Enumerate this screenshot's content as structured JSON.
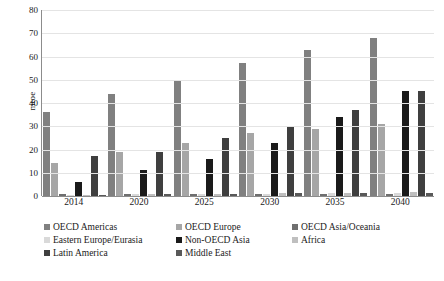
{
  "chart_data": {
    "type": "bar",
    "title": "",
    "subtitle": "",
    "xlabel": "",
    "ylabel": "mtoe",
    "ylim": [
      0,
      80
    ],
    "yticks": [
      0,
      10,
      20,
      30,
      40,
      50,
      60,
      70,
      80
    ],
    "grid": true,
    "legend_position": "bottom",
    "categories": [
      "2014",
      "2020",
      "2025",
      "2030",
      "2035",
      "2040"
    ],
    "series": [
      {
        "name": "OECD Americas",
        "color": "#808080",
        "values": [
          36,
          44,
          50,
          57,
          63,
          68
        ]
      },
      {
        "name": "OECD Europe",
        "color": "#a6a6a6",
        "values": [
          14,
          19,
          23,
          27,
          29,
          31
        ]
      },
      {
        "name": "OECD Asia/Oceania",
        "color": "#6f6f6f",
        "values": [
          1,
          1,
          1,
          1,
          1,
          1
        ]
      },
      {
        "name": "Eastern Europe/Eurasia",
        "color": "#d9d9d9",
        "values": [
          0.6,
          0.8,
          0.9,
          1,
          1.2,
          1.4
        ]
      },
      {
        "name": "Non-OECD Asia",
        "color": "#1a1a1a",
        "values": [
          6,
          11,
          16,
          23,
          34,
          45
        ]
      },
      {
        "name": "Africa",
        "color": "#bfbfbf",
        "values": [
          0.5,
          0.8,
          1,
          1.2,
          1.5,
          1.8
        ]
      },
      {
        "name": "Latin America",
        "color": "#3f3f3f",
        "values": [
          17,
          19,
          25,
          30,
          37,
          45
        ]
      },
      {
        "name": "Middle East",
        "color": "#595959",
        "values": [
          0.5,
          0.7,
          0.9,
          1.1,
          1.3,
          1.5
        ]
      }
    ]
  },
  "legend": {
    "rows": [
      [
        {
          "label": "OECD Americas",
          "color": "#808080"
        },
        {
          "label": "OECD Europe",
          "color": "#a6a6a6"
        },
        {
          "label": "OECD Asia/Oceania",
          "color": "#6f6f6f"
        }
      ],
      [
        {
          "label": "Eastern Europe/Eurasia",
          "color": "#d9d9d9"
        },
        {
          "label": "Non-OECD Asia",
          "color": "#1a1a1a"
        },
        {
          "label": "Africa",
          "color": "#bfbfbf"
        }
      ],
      [
        {
          "label": "Latin America",
          "color": "#3f3f3f"
        },
        {
          "label": "Middle East",
          "color": "#595959"
        }
      ]
    ]
  }
}
